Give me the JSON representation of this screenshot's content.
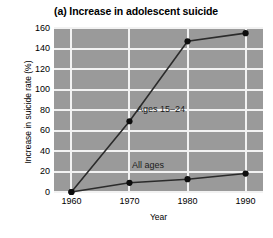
{
  "chart_data": {
    "type": "line",
    "title": "(a) Increase in adolescent suicide",
    "xlabel": "Year",
    "ylabel": "Increase in suicide rate (%)",
    "x": [
      1960,
      1970,
      1980,
      1990
    ],
    "xtick_labels": [
      "1960",
      "1970",
      "1980",
      "1990"
    ],
    "xlim": [
      1957,
      1993
    ],
    "ylim": [
      0,
      160
    ],
    "ytick_values": [
      0,
      20,
      40,
      60,
      80,
      100,
      120,
      140,
      160
    ],
    "ytick_labels": [
      "0",
      "20",
      "40",
      "60",
      "80",
      "100",
      "120",
      "140",
      "160"
    ],
    "grid": true,
    "legend_position": "inline-annotations",
    "plot_background_color": "#9a9a9a",
    "gridline_color": "#f2f2f2",
    "line_color": "#2b2b2b",
    "marker_color": "#0d0d0d",
    "series": [
      {
        "name": "Ages 15-24",
        "label": "Ages 15–24",
        "values": [
          0,
          69,
          147,
          155
        ]
      },
      {
        "name": "All ages",
        "label": "All ages",
        "values": [
          0,
          9,
          12.5,
          18
        ]
      }
    ]
  }
}
